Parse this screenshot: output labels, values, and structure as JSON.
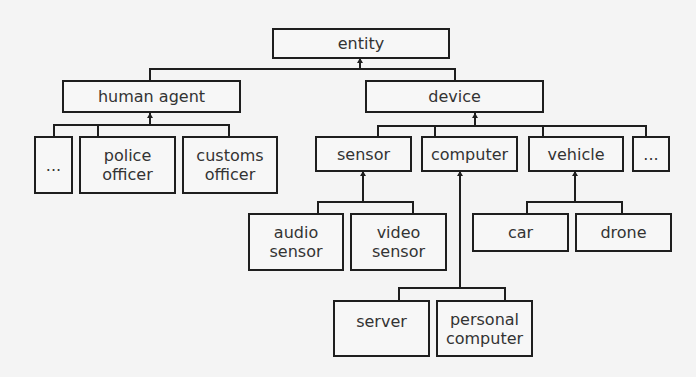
{
  "diagram": {
    "type": "hierarchy",
    "colors": {
      "background": "#f4f4f4",
      "border": "#1e1e1e",
      "text": "#333333"
    },
    "nodes": {
      "entity": "entity",
      "human_agent": "human agent",
      "device": "device",
      "human_other": "...",
      "police_officer": "police\nofficer",
      "customs_officer": "customs\nofficer",
      "sensor": "sensor",
      "computer": "computer",
      "vehicle": "vehicle",
      "device_other": "...",
      "audio_sensor": "audio\nsensor",
      "video_sensor": "video\nsensor",
      "car": "car",
      "drone": "drone",
      "server": "server",
      "personal_computer": "personal\ncomputer"
    },
    "edges": [
      [
        "human agent",
        "entity"
      ],
      [
        "device",
        "entity"
      ],
      [
        "...",
        "human agent"
      ],
      [
        "police officer",
        "human agent"
      ],
      [
        "customs officer",
        "human agent"
      ],
      [
        "sensor",
        "device"
      ],
      [
        "computer",
        "device"
      ],
      [
        "vehicle",
        "device"
      ],
      [
        "...",
        "device"
      ],
      [
        "audio sensor",
        "sensor"
      ],
      [
        "video sensor",
        "sensor"
      ],
      [
        "car",
        "vehicle"
      ],
      [
        "drone",
        "vehicle"
      ],
      [
        "server",
        "computer"
      ],
      [
        "personal computer",
        "computer"
      ]
    ]
  }
}
